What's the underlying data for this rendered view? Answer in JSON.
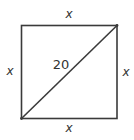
{
  "diagram": {
    "type": "square-with-diagonal",
    "labels": {
      "top": "x",
      "bottom": "x",
      "left": "x",
      "right": "x",
      "diagonal": "20"
    },
    "colors": {
      "stroke": "#3a3a3a",
      "text": "#333333",
      "background": "#ffffff"
    }
  }
}
